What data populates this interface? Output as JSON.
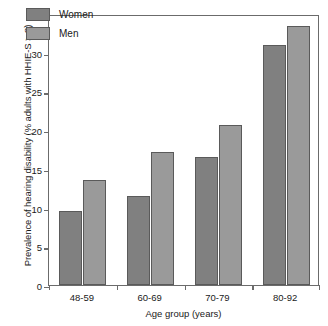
{
  "chart_data": {
    "type": "bar",
    "title": "",
    "xlabel": "Age group (years)",
    "ylabel": "Prevalence of hearing disability (% adults with HHIE-S > 8)",
    "categories": [
      "48-59",
      "60-69",
      "70-79",
      "80-92"
    ],
    "series": [
      {
        "name": "Women",
        "color": "#808080",
        "values": [
          9.6,
          11.5,
          16.5,
          31.0
        ]
      },
      {
        "name": "Men",
        "color": "#9a9a9a",
        "values": [
          13.5,
          17.2,
          20.7,
          33.4
        ]
      }
    ],
    "ylim": [
      0,
      35
    ],
    "yticks": [
      0,
      5,
      10,
      15,
      20,
      25,
      30,
      35
    ],
    "ytick_labels": [
      "0",
      "5",
      "10",
      "15",
      "20",
      "25",
      "30",
      "35"
    ],
    "grid": false,
    "legend_position": "top-left",
    "frame": true,
    "axis_color": "#6b6b6b",
    "bar_edge_color": "#5a5a5a",
    "background": "#ffffff"
  }
}
